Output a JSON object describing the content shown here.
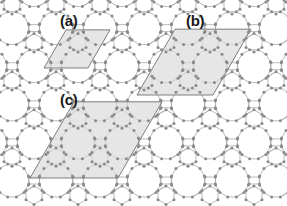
{
  "figure": {
    "type": "crystal-lattice-unit-cell-diagram",
    "width": 287,
    "height": 206,
    "background_color": "#ffffff"
  },
  "lattice": {
    "vertex_color": "#8a8a8a",
    "vertex_radius": 1.5,
    "bond_color": "#aaaaaa",
    "bond_width": 0.8,
    "ring_types": [
      "dodecagon",
      "hexagon",
      "square"
    ],
    "unit_vector_a_deg": 0,
    "unit_vector_b_deg": 60,
    "period_x": 44,
    "period_y": 38.1
  },
  "cells": [
    {
      "id": "a",
      "label": "(a)",
      "order": 1,
      "fill_color": "#dcdcdc",
      "fill_opacity": 0.72,
      "stroke_color": "#6f6f6f",
      "stroke_width": 0.9,
      "side_length": 44,
      "angle_deg": 60,
      "origin_x": 44,
      "origin_y": 68,
      "contains": "one dodecagon plus adjoining hexagons and squares"
    },
    {
      "id": "b",
      "label": "(b)",
      "order": 2,
      "fill_color": "#dcdcdc",
      "fill_opacity": 0.72,
      "stroke_color": "#6f6f6f",
      "stroke_width": 0.9,
      "side_length": 76,
      "angle_deg": 60,
      "origin_x": 137,
      "origin_y": 95,
      "contains": "enlarged supercell spanning several dodecagonal rings"
    },
    {
      "id": "c",
      "label": "(c)",
      "order": 3,
      "fill_color": "#dcdcdc",
      "fill_opacity": 0.72,
      "stroke_color": "#6f6f6f",
      "stroke_width": 0.9,
      "side_length": 88,
      "angle_deg": 60,
      "origin_x": 30,
      "origin_y": 178,
      "contains": "large supercell with central dodecagon ringed by smaller polygons"
    }
  ]
}
